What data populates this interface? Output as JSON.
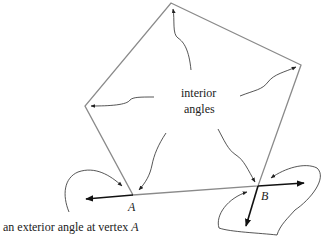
{
  "diagram": {
    "center_label": {
      "line1": "interior",
      "line2": "angles"
    },
    "vertex_labels": {
      "a": "A",
      "b": "B"
    },
    "exterior_caption": "an exterior angle at vertex A",
    "vertices": {
      "top": [
        171,
        3
      ],
      "right": [
        301,
        65
      ],
      "b": [
        258,
        186
      ],
      "a": [
        133,
        195
      ],
      "left": [
        85,
        106
      ]
    },
    "colors": {
      "polygon": "#8a8a8a",
      "arrows": "#2b2b2b",
      "rays": "#111111",
      "background": "#ffffff"
    }
  }
}
